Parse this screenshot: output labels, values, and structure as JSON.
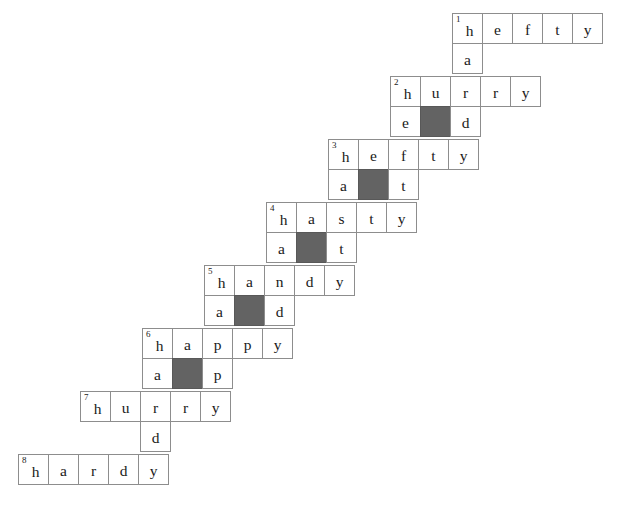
{
  "puzzle": {
    "title": "Staircase Word Ladder Grid",
    "cell_size": 31,
    "origin": {
      "x": 452,
      "y": 13
    },
    "row_step": {
      "dx": -62,
      "dy": 63
    },
    "colors": {
      "grid_line": "#8d8d8d",
      "block_fill": "#636363",
      "cell_fill": "#ffffff",
      "text": "#1a1a1a"
    },
    "entries": [
      {
        "number": "1",
        "across": "hefty",
        "across_letters": [
          "h",
          "e",
          "f",
          "t",
          "y"
        ],
        "down_letters": [
          "h",
          "a"
        ],
        "stem": {
          "left": "a",
          "block": "",
          "right": ""
        },
        "stem_cells": [
          {
            "letter": "a",
            "col": 0,
            "block": false
          },
          {
            "letter": "",
            "col": 1,
            "block": false,
            "omit": true
          },
          {
            "letter": "",
            "col": 2,
            "block": false,
            "omit": true
          }
        ]
      },
      {
        "number": "2",
        "across": "hurry",
        "across_letters": [
          "h",
          "u",
          "r",
          "r",
          "y"
        ],
        "stem_cells": [
          {
            "letter": "e",
            "col": 0,
            "block": false
          },
          {
            "letter": "",
            "col": 1,
            "block": true
          },
          {
            "letter": "d",
            "col": 2,
            "block": false
          }
        ]
      },
      {
        "number": "3",
        "across": "hefty",
        "across_letters": [
          "h",
          "e",
          "f",
          "t",
          "y"
        ],
        "stem_cells": [
          {
            "letter": "a",
            "col": 0,
            "block": false
          },
          {
            "letter": "",
            "col": 1,
            "block": true
          },
          {
            "letter": "t",
            "col": 2,
            "block": false
          }
        ]
      },
      {
        "number": "4",
        "across": "hasty",
        "across_letters": [
          "h",
          "a",
          "s",
          "t",
          "y"
        ],
        "stem_cells": [
          {
            "letter": "a",
            "col": 0,
            "block": false
          },
          {
            "letter": "",
            "col": 1,
            "block": true
          },
          {
            "letter": "t",
            "col": 2,
            "block": false
          }
        ]
      },
      {
        "number": "5",
        "across": "handy",
        "across_letters": [
          "h",
          "a",
          "n",
          "d",
          "y"
        ],
        "stem_cells": [
          {
            "letter": "a",
            "col": 0,
            "block": false
          },
          {
            "letter": "",
            "col": 1,
            "block": true
          },
          {
            "letter": "d",
            "col": 2,
            "block": false
          }
        ]
      },
      {
        "number": "6",
        "across": "happy",
        "across_letters": [
          "h",
          "a",
          "p",
          "p",
          "y"
        ],
        "stem_cells": [
          {
            "letter": "a",
            "col": 0,
            "block": false
          },
          {
            "letter": "",
            "col": 1,
            "block": true
          },
          {
            "letter": "p",
            "col": 2,
            "block": false
          }
        ]
      },
      {
        "number": "7",
        "across": "hurry",
        "across_letters": [
          "h",
          "u",
          "r",
          "r",
          "y"
        ],
        "stem_cells": [
          {
            "letter": "",
            "col": 0,
            "block": false,
            "omit": true
          },
          {
            "letter": "",
            "col": 1,
            "block": false,
            "omit": true
          },
          {
            "letter": "d",
            "col": 2,
            "block": false
          }
        ]
      },
      {
        "number": "8",
        "across": "hardy",
        "across_letters": [
          "h",
          "a",
          "r",
          "d",
          "y"
        ],
        "stem_cells": []
      }
    ]
  }
}
